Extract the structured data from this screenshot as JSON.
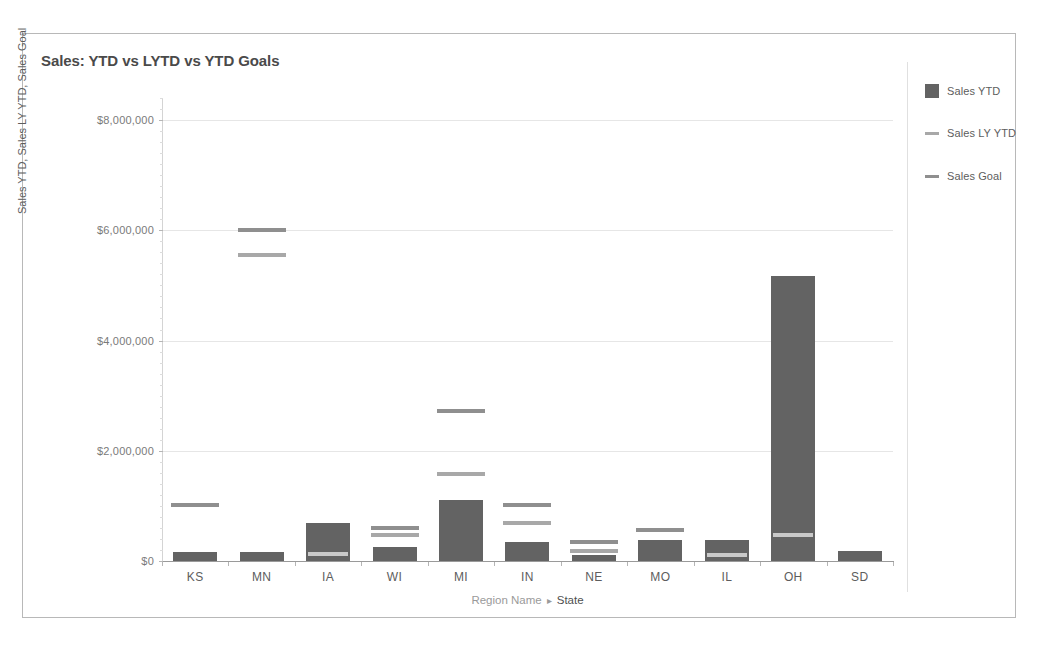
{
  "chart_data": {
    "type": "bar",
    "title": "Sales: YTD vs LYTD vs YTD Goals",
    "xlabel_parts": {
      "dimension": "Region Name",
      "separator": "▸",
      "field": "State"
    },
    "ylabel": "Sales YTD, Sales LY YTD, Sales Goal",
    "categories": [
      "KS",
      "MN",
      "IA",
      "WI",
      "MI",
      "IN",
      "NE",
      "MO",
      "IL",
      "OH",
      "SD"
    ],
    "ylim": [
      0,
      8400000
    ],
    "ytick_values": [
      0,
      2000000,
      4000000,
      6000000,
      8000000
    ],
    "ytick_labels": [
      "$0",
      "$2,000,000",
      "$4,000,000",
      "$6,000,000",
      "$8,000,000"
    ],
    "grid": true,
    "legend_position": "right",
    "series": [
      {
        "name": "Sales YTD",
        "mark": "bar",
        "color": "#636363",
        "values": [
          170000,
          160000,
          690000,
          250000,
          1110000,
          340000,
          110000,
          390000,
          390000,
          5170000,
          190000
        ]
      },
      {
        "name": "Sales LY YTD",
        "mark": "reference-line",
        "color": "#a8a8a8",
        "values": [
          null,
          5550000,
          120000,
          480000,
          1570000,
          690000,
          190000,
          null,
          110000,
          480000,
          null
        ]
      },
      {
        "name": "Sales Goal",
        "mark": "reference-line",
        "color": "#8f8f8f",
        "values": [
          1010000,
          6000000,
          null,
          600000,
          2730000,
          1010000,
          340000,
          570000,
          null,
          null,
          null
        ]
      }
    ]
  },
  "legend": {
    "items": [
      {
        "label": "Sales YTD",
        "mark": "square",
        "color": "#636363"
      },
      {
        "label": "Sales LY YTD",
        "mark": "line",
        "color": "#a8a8a8"
      },
      {
        "label": "Sales Goal",
        "mark": "line",
        "color": "#8f8f8f"
      }
    ]
  }
}
